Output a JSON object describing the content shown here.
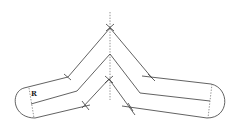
{
  "diagram": {
    "type": "bent-strip-reflection",
    "labels": {
      "radius": "R"
    },
    "colors": {
      "line": "#3a3a3a",
      "dotted": "#777777",
      "background": "#ffffff"
    },
    "elements": [
      "symmetry-axis",
      "outer-edge",
      "center-line",
      "inner-edge",
      "left-end-cap",
      "right-end-cap",
      "cut-marks"
    ]
  }
}
